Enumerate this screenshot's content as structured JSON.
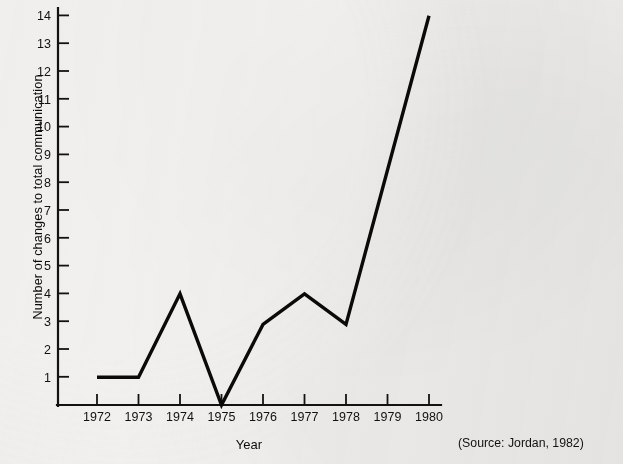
{
  "chart_data": {
    "type": "line",
    "title": "",
    "xlabel": "Year",
    "ylabel": "Number of changes to total communication",
    "x": [
      1972,
      1973,
      1974,
      1975,
      1976,
      1977,
      1978,
      1979,
      1980
    ],
    "categories": [
      "1972",
      "1973",
      "1974",
      "1975",
      "1976",
      "1977",
      "1978",
      "1979",
      "1980"
    ],
    "values": [
      1,
      1,
      4,
      0,
      2.9,
      4,
      2.9,
      8.4,
      14
    ],
    "series": [
      {
        "name": "Number of changes to total communication",
        "values": [
          1,
          1,
          4,
          0,
          2.9,
          4,
          2.9,
          8.4,
          14
        ]
      }
    ],
    "xlim": [
      1972,
      1980
    ],
    "ylim": [
      0,
      14
    ],
    "y_ticks": [
      1,
      2,
      3,
      4,
      5,
      6,
      7,
      8,
      9,
      10,
      11,
      12,
      13,
      14
    ],
    "y_tick_labels": [
      "1",
      "2",
      "3",
      "4",
      "5",
      "6",
      "7",
      "8",
      "9",
      "10",
      "11",
      "12",
      "13",
      "14"
    ],
    "x_ticks": [
      1972,
      1973,
      1974,
      1975,
      1976,
      1977,
      1978,
      1979,
      1980
    ],
    "x_tick_labels": [
      "1972",
      "1973",
      "1974",
      "1975",
      "1976",
      "1977",
      "1978",
      "1979",
      "1980"
    ],
    "grid": false,
    "legend": "none",
    "line_color": "#0a0a0a",
    "background_color": "#f2f1ef",
    "vertex_years": [
      1972,
      1973,
      1974,
      1975,
      1976,
      1977,
      1978,
      1980
    ]
  },
  "annotations": {
    "source": "(Source: Jordan, 1982)"
  }
}
